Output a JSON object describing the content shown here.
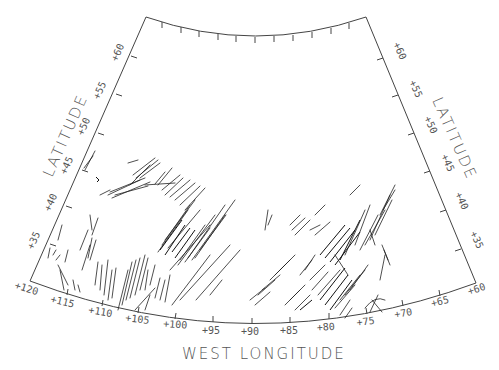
{
  "map": {
    "projection": "conic",
    "axis_titles": {
      "bottom": "WEST LONGITUDE",
      "left": "LATITUDE",
      "right": "LATITUDE"
    },
    "longitude_labels": [
      "+120",
      "+115",
      "+110",
      "+105",
      "+100",
      "+95",
      "+90",
      "+85",
      "+80",
      "+75",
      "+70",
      "+65",
      "+60"
    ],
    "latitude_labels_left": [
      "+60",
      "+55",
      "+50",
      "+45",
      "+40",
      "+35"
    ],
    "latitude_labels_right": [
      "+60",
      "+55",
      "+50",
      "+45",
      "+40",
      "+35"
    ],
    "lon_range": [
      120,
      60
    ],
    "lat_range": [
      30,
      65
    ],
    "frame_color": "#444444",
    "line_color": "#222222",
    "content": "line segments indicating orientations, clustered over western US (~+115 to +95) and eastern US (~+90 to +75)"
  }
}
